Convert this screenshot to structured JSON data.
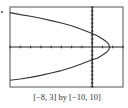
{
  "chart_data": {
    "type": "line",
    "title": "",
    "caption": "[−8, 3] by [−10, 10]",
    "xlabel": "",
    "ylabel": "",
    "xlim": [
      -8,
      3
    ],
    "ylim": [
      -10,
      10
    ],
    "xscl": 1,
    "yscl": 1,
    "grid": false,
    "legend": null,
    "series": [
      {
        "name": "parabola",
        "x": [
          -8.0,
          -7.0,
          -6.0,
          -5.0,
          -4.0,
          -3.0,
          -2.0,
          -1.0,
          0.0,
          0.5,
          1.0,
          1.4,
          1.6,
          1.7,
          1.6,
          1.4,
          1.0,
          0.5,
          0.0,
          -1.0,
          -2.0,
          -3.0,
          -4.0,
          -5.0,
          -6.0,
          -7.0,
          -8.0
        ],
        "y": [
          8.6,
          8.1,
          7.7,
          7.2,
          6.6,
          6.0,
          5.3,
          4.4,
          3.4,
          2.8,
          2.0,
          1.3,
          0.8,
          0.0,
          -0.8,
          -1.3,
          -2.0,
          -2.8,
          -3.2,
          -4.2,
          -5.1,
          -5.9,
          -6.5,
          -7.1,
          -7.6,
          -8.0,
          -8.3
        ]
      }
    ]
  },
  "frame": {
    "left_px": 10,
    "top_px": 7,
    "right_px": 123,
    "bottom_px": 87,
    "border_color": "#6f6f6f",
    "axis_color": "#222222",
    "curve_color": "#333333"
  }
}
